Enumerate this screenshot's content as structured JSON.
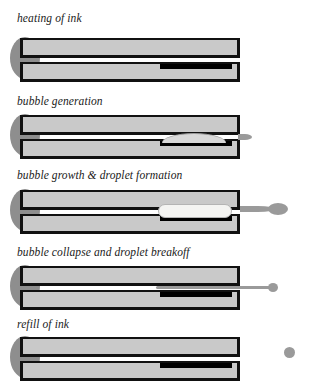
{
  "diagram": {
    "colors": {
      "background": "#ffffff",
      "chamber_fill": "#c9c9c9",
      "chamber_outline": "#111111",
      "reservoir": "#8e8e8e",
      "heater": "#000000",
      "ink_droplet": "#9a9a9a",
      "vapor_bubble": "#f4f4f2",
      "label_text": "#1a1a1a"
    },
    "stages": [
      {
        "index": 1,
        "label": "heating of ink",
        "heater_state": "energized",
        "bubble": "none",
        "droplet": "none"
      },
      {
        "index": 2,
        "label": "bubble generation",
        "heater_state": "energized",
        "bubble": "small-lens",
        "droplet": "nozzle-nub"
      },
      {
        "index": 3,
        "label": "bubble growth & droplet formation",
        "heater_state": "energized",
        "bubble": "large-expanded",
        "droplet": "extending-on-neck"
      },
      {
        "index": 4,
        "label": "bubble collapse and droplet breakoff",
        "heater_state": "off",
        "bubble": "collapsed",
        "droplet": "pinching-tail"
      },
      {
        "index": 5,
        "label": "refill of ink",
        "heater_state": "off",
        "bubble": "none",
        "droplet": "detached-free-droplet"
      }
    ]
  }
}
